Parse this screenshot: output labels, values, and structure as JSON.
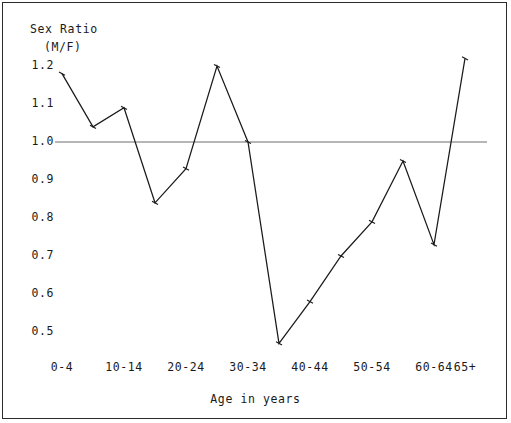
{
  "chart_data": {
    "type": "line",
    "title": "",
    "ylabel": "Sex Ratio\n(M/F)",
    "ylabel_line1": "Sex Ratio",
    "ylabel_line2": "(M/F)",
    "xlabel": "Age in years",
    "ylim": [
      0.45,
      1.25
    ],
    "yticks": [
      "1.2",
      "1.1",
      "1.0",
      "0.9",
      "0.8",
      "0.7",
      "0.6",
      "0.5"
    ],
    "ytick_values": [
      1.2,
      1.1,
      1.0,
      0.9,
      0.8,
      0.7,
      0.6,
      0.5
    ],
    "xtick_labels": [
      "0-4",
      "10-14",
      "20-24",
      "30-34",
      "40-44",
      "50-54",
      "60-64",
      "65+"
    ],
    "categories": [
      "0-4",
      "5-9",
      "10-14",
      "15-19",
      "20-24",
      "25-29",
      "30-34",
      "35-39",
      "40-44",
      "45-49",
      "50-54",
      "55-59",
      "60-64",
      "65+"
    ],
    "values": [
      1.18,
      1.04,
      1.09,
      0.84,
      0.93,
      1.2,
      1.0,
      0.47,
      0.58,
      0.7,
      0.79,
      0.95,
      0.73,
      1.22
    ],
    "reference_line": {
      "y": 1.0,
      "label": "1.0"
    },
    "grid": false,
    "legend": false,
    "marker": "tick",
    "line_color": "#1a1a1a",
    "reference_color": "#6e6e6e",
    "background": "#ffffff",
    "border_color": "#2b2b2b"
  }
}
